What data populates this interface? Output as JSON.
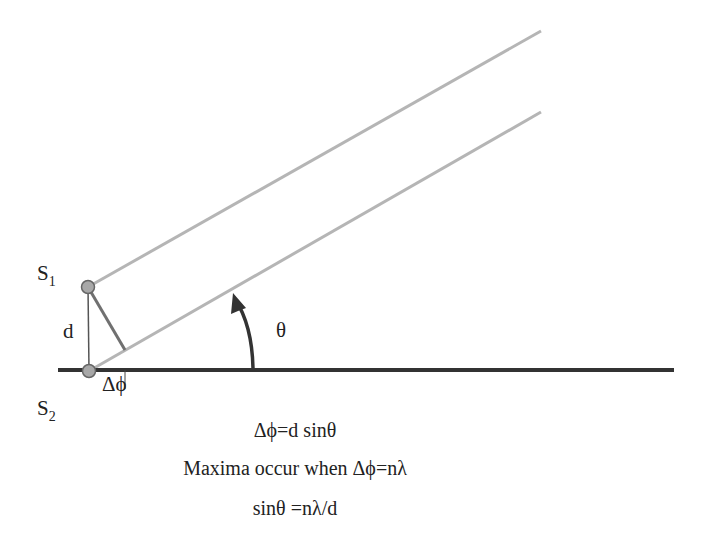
{
  "diagram": {
    "labels": {
      "s1": {
        "main": "S",
        "sub": "1"
      },
      "s2": {
        "main": "S",
        "sub": "2"
      },
      "separation": "d",
      "path_difference": "Δϕ",
      "angle": "θ"
    },
    "equations": [
      "Δϕ=d sinθ",
      "Maxima occur when Δϕ=nλ",
      "sinθ =nλ/d"
    ],
    "colors": {
      "baseline": "#333333",
      "rays": "#b5b5b5",
      "perpendicular": "#707070",
      "source_fill": "#a8a8a8",
      "arrow": "#333333",
      "text": "#222222"
    }
  }
}
